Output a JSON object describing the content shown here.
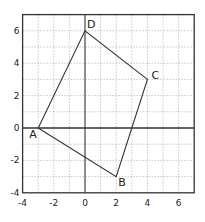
{
  "diagram": {
    "type": "coordinate-plane-quadrilateral",
    "x_range": [
      -4,
      7
    ],
    "y_range": [
      -4,
      7
    ],
    "grid_step": 1,
    "x_tick_labels": [
      "-4",
      "-2",
      "0",
      "2",
      "4",
      "6"
    ],
    "x_tick_values": [
      -4,
      -2,
      0,
      2,
      4,
      6
    ],
    "y_tick_labels": [
      "-4",
      "-2",
      "0",
      "2",
      "4",
      "6"
    ],
    "y_tick_values": [
      -4,
      -2,
      0,
      2,
      4,
      6
    ],
    "vertices": [
      {
        "label": "A",
        "x": -3,
        "y": 0
      },
      {
        "label": "B",
        "x": 2,
        "y": -3
      },
      {
        "label": "C",
        "x": 4,
        "y": 3
      },
      {
        "label": "D",
        "x": 0,
        "y": 6
      }
    ],
    "colors": {
      "line": "#333333",
      "grid": "#888888",
      "background": "#ffffff"
    }
  }
}
